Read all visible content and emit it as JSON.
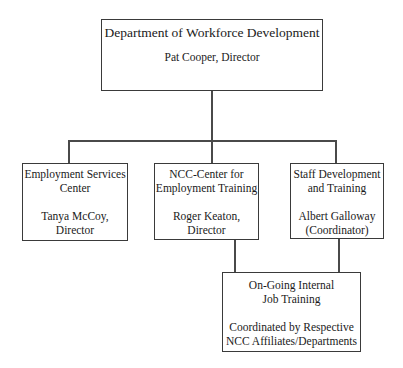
{
  "org_chart": {
    "root": {
      "title": "Department of Workforce Development",
      "person": "Pat Cooper, Director"
    },
    "children": [
      {
        "title_line1": "Employment Services",
        "title_line2": "Center",
        "person_line1": "Tanya McCoy,",
        "person_line2": "Director"
      },
      {
        "title_line1": "NCC-Center for",
        "title_line2": "Employment Training",
        "person_line1": "Roger Keaton,",
        "person_line2": "Director"
      },
      {
        "title_line1": "Staff Development",
        "title_line2": "and Training",
        "person_line1": "Albert Galloway",
        "person_line2": "(Coordinator)"
      }
    ],
    "shared_child": {
      "title_line1": "On-Going Internal",
      "title_line2": "Job Training",
      "note_line1": "Coordinated by Respective",
      "note_line2": "NCC Affiliates/Departments",
      "parents": [
        "NCC-Center for Employment Training",
        "Staff Development and Training"
      ]
    },
    "colors": {
      "line": "#4a4a4a",
      "border": "#3a3a3a",
      "text": "#1a1a1a",
      "background": "#ffffff"
    }
  }
}
